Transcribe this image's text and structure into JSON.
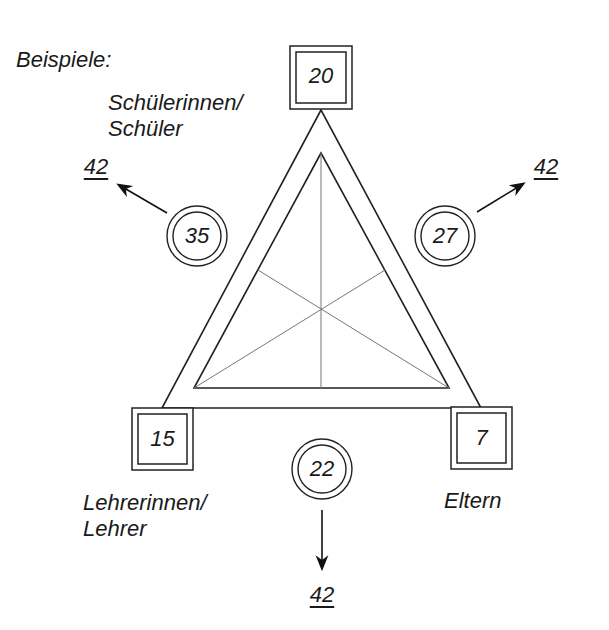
{
  "title": "Beispiele:",
  "nodes": {
    "top": {
      "label_line1": "Schülerinnen/",
      "label_line2": "Schüler",
      "value": "20"
    },
    "bottom_left": {
      "label_line1": "Lehrerinnen/",
      "label_line2": "Lehrer",
      "value": "15"
    },
    "bottom_right": {
      "label": "Eltern",
      "value": "7"
    }
  },
  "edges": {
    "left": {
      "value": "35",
      "result": "42"
    },
    "right": {
      "value": "27",
      "result": "42"
    },
    "bottom": {
      "value": "22",
      "result": "42"
    }
  }
}
